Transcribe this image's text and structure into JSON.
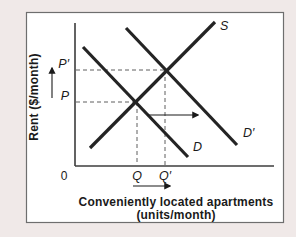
{
  "figure": {
    "page_bg": "#f0e9e8",
    "panel_bg": "#ffffff",
    "panel_border": "#6e6e6e",
    "line_color": "#242424",
    "dash_color": "#5f5f5f",
    "axis_color": "#3c3c3c",
    "text_color": "#1a1a1a"
  },
  "chart_data": {
    "type": "line",
    "ylabel": "Rent ($/month)",
    "xlabel_line1": "Conveniently located apartments",
    "xlabel_line2": "(units/month)",
    "origin_label": "0",
    "axes": {
      "x0": 75,
      "y0": 166,
      "x_end": 274,
      "y_top": 23,
      "grid": false
    },
    "series": [
      {
        "name": "S",
        "role": "supply",
        "x1": 90,
        "y1": 148,
        "x2": 215,
        "y2": 22,
        "label_x": 220,
        "label_y": 30
      },
      {
        "name": "D",
        "role": "demand-initial",
        "x1": 83,
        "y1": 47,
        "x2": 188,
        "y2": 157,
        "label_x": 193,
        "label_y": 151
      },
      {
        "name": "D′",
        "role": "demand-shifted",
        "x1": 126,
        "y1": 28,
        "x2": 237,
        "y2": 145,
        "label_x": 243,
        "label_y": 137
      }
    ],
    "equilibria": [
      {
        "id": "initial",
        "price_label": "P",
        "quantity_label": "Q",
        "x": 137,
        "y": 102
      },
      {
        "id": "new",
        "price_label": "P′",
        "quantity_label": "Q′",
        "x": 165,
        "y": 70
      }
    ],
    "arrows": [
      {
        "name": "price-increase-arrow",
        "x1": 52,
        "y1": 98,
        "x2": 52,
        "y2": 68
      },
      {
        "name": "demand-shift-arrow",
        "x1": 147,
        "y1": 115,
        "x2": 198,
        "y2": 115
      },
      {
        "name": "quantity-increase-arrow",
        "x1": 133,
        "y1": 186,
        "x2": 170,
        "y2": 186
      }
    ]
  }
}
